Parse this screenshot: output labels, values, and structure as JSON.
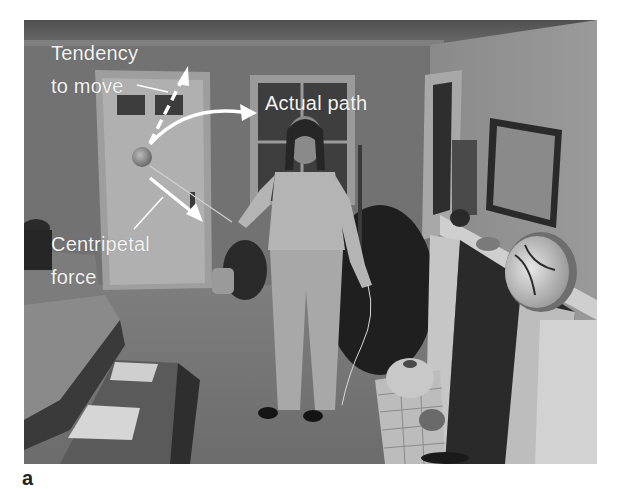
{
  "figure": {
    "panel_letter": "a",
    "annotations": {
      "tendency_line1": "Tendency",
      "tendency_line2": "to move",
      "actual_path": "Actual path",
      "centripetal_line1": "Centripetal",
      "centripetal_line2": "force"
    },
    "scene": {
      "description": "Grayscale photo of a woman in a living room swinging a ball on a string in a circle",
      "objects": [
        "woman",
        "ball",
        "string",
        "door",
        "window",
        "sofa",
        "coffee-table",
        "fireplace",
        "mantel",
        "framed-painting",
        "vase",
        "pottery"
      ]
    },
    "colors": {
      "annotation_text": "#f4f4f4",
      "arrow": "#ffffff",
      "wall": "#7a7a7a",
      "floor": "#8c8c8c",
      "background": "#ffffff"
    }
  }
}
